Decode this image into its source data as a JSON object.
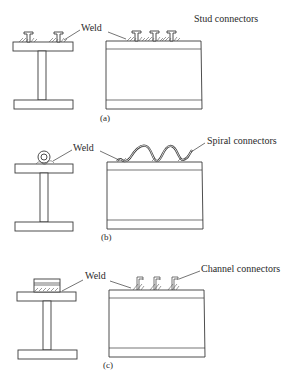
{
  "diagram": {
    "panels": [
      {
        "id": "a",
        "caption": "(a)",
        "weld_label": "Weld",
        "connector_label": "Stud connectors",
        "connector_type": "stud",
        "beam_connector_count": 2,
        "slab_connector_count": 3
      },
      {
        "id": "b",
        "caption": "(b)",
        "weld_label": "Weld",
        "connector_label": "Spiral connectors",
        "connector_type": "spiral",
        "beam_connector_count": 1,
        "slab_spiral_turns": 2
      },
      {
        "id": "c",
        "caption": "(c)",
        "weld_label": "Weld",
        "connector_label": "Channel connectors",
        "connector_type": "channel",
        "beam_connector_count": 1,
        "slab_connector_count": 3
      }
    ],
    "colors": {
      "line": "#3a3a3a",
      "text": "#2a2a2a",
      "background": "#ffffff"
    }
  }
}
